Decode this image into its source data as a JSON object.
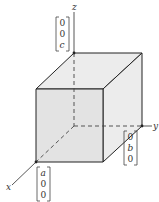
{
  "diagram": {
    "type": "3d-box-with-axes",
    "axes": {
      "x": {
        "label": "x"
      },
      "y": {
        "label": "y"
      },
      "z": {
        "label": "z"
      }
    },
    "vectors": {
      "z_vector": {
        "entries": [
          "0",
          "0",
          "c"
        ]
      },
      "y_vector": {
        "entries": [
          "0",
          "b",
          "0"
        ]
      },
      "x_vector": {
        "entries": [
          "a",
          "0",
          "0"
        ]
      }
    },
    "colors": {
      "face_fill": "#e6e6e6",
      "edge": "#222222",
      "axis": "#444444"
    }
  }
}
